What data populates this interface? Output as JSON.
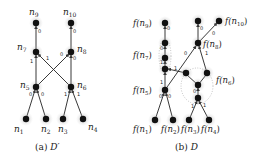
{
  "figure": {
    "panels": [
      {
        "id": "a",
        "caption": "(a) D′",
        "caption_prefix": "(a)",
        "caption_symbol": "D′",
        "nodes": [
          {
            "id": "n9",
            "label": "n",
            "sub": "9",
            "x": 36,
            "y": 23
          },
          {
            "id": "n10",
            "label": "n",
            "sub": "10",
            "x": 71,
            "y": 23
          },
          {
            "id": "n7",
            "label": "n",
            "sub": "7",
            "x": 36,
            "y": 52
          },
          {
            "id": "n8",
            "label": "n",
            "sub": "8",
            "x": 71,
            "y": 52
          },
          {
            "id": "n5",
            "label": "n",
            "sub": "5",
            "x": 36,
            "y": 87
          },
          {
            "id": "n6",
            "label": "n",
            "sub": "6",
            "x": 71,
            "y": 87
          },
          {
            "id": "n1",
            "label": "n",
            "sub": "1",
            "x": 26,
            "y": 119
          },
          {
            "id": "n2",
            "label": "n",
            "sub": "2",
            "x": 46,
            "y": 119
          },
          {
            "id": "n3",
            "label": "n",
            "sub": "3",
            "x": 63,
            "y": 119
          },
          {
            "id": "n4",
            "label": "n",
            "sub": "4",
            "x": 83,
            "y": 119
          }
        ],
        "edges": [
          {
            "from": "n7",
            "to": "n9",
            "label": "0"
          },
          {
            "from": "n8",
            "to": "n10",
            "label": "0"
          },
          {
            "from": "n5",
            "to": "n7",
            "label": "1"
          },
          {
            "from": "n6",
            "to": "n7",
            "label": "1"
          },
          {
            "from": "n5",
            "to": "n8",
            "label": "0"
          },
          {
            "from": "n6",
            "to": "n8",
            "label": "0"
          },
          {
            "from": "n1",
            "to": "n5",
            "label": "0"
          },
          {
            "from": "n2",
            "to": "n5",
            "label": "0"
          },
          {
            "from": "n3",
            "to": "n6",
            "label": "1"
          },
          {
            "from": "n4",
            "to": "n6",
            "label": "1"
          }
        ]
      },
      {
        "id": "b",
        "caption": "(b) D",
        "caption_prefix": "(b)",
        "caption_symbol": "D",
        "node_labels": [
          {
            "text": "f(n",
            "sub": "9",
            "close": ")"
          },
          {
            "text": "f(n",
            "sub": "10",
            "close": ")"
          },
          {
            "text": "f(n",
            "sub": "8",
            "close": ")"
          },
          {
            "text": "f(n",
            "sub": "7",
            "close": ")"
          },
          {
            "text": "f(n",
            "sub": "6",
            "close": ")"
          },
          {
            "text": "f(n",
            "sub": "5",
            "close": ")"
          },
          {
            "text": "f(n",
            "sub": "1",
            "close": ")"
          },
          {
            "text": "f(n",
            "sub": "2",
            "close": ")"
          },
          {
            "text": "f(n",
            "sub": "3",
            "close": ")"
          },
          {
            "text": "f(n",
            "sub": "4",
            "close": ")"
          }
        ],
        "edge_labels": [
          "0",
          "0",
          "0",
          "0",
          "1",
          "0",
          "1",
          "1",
          "1",
          "0",
          "0",
          "0",
          "1",
          "1"
        ]
      }
    ]
  }
}
